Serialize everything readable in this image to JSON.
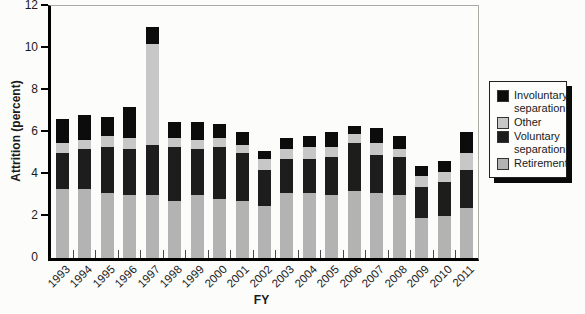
{
  "chart_data": {
    "type": "bar",
    "stacked": true,
    "title": "",
    "xlabel": "FY",
    "ylabel": "Attrition (percent)",
    "ylim": [
      0,
      12
    ],
    "yticks": [
      0,
      2,
      4,
      6,
      8,
      10,
      12
    ],
    "grid": false,
    "legend_position": "right-outside",
    "categories": [
      "1993",
      "1994",
      "1995",
      "1996",
      "1997",
      "1998",
      "1999",
      "2000",
      "2001",
      "2002",
      "2003",
      "2004",
      "2005",
      "2006",
      "2007",
      "2008",
      "2009",
      "2010",
      "2011"
    ],
    "series": [
      {
        "name": "Retirement",
        "color": "#b3b3b3",
        "values": [
          3.3,
          3.3,
          3.1,
          3.0,
          3.0,
          2.7,
          3.0,
          2.8,
          2.7,
          2.5,
          3.1,
          3.1,
          3.0,
          3.2,
          3.1,
          3.0,
          1.9,
          2.0,
          2.4
        ]
      },
      {
        "name": "Voluntary separation",
        "color": "#1d1d1d",
        "values": [
          1.7,
          1.9,
          2.2,
          2.2,
          2.4,
          2.6,
          2.2,
          2.5,
          2.3,
          1.7,
          1.6,
          1.6,
          1.8,
          2.3,
          1.8,
          1.8,
          1.5,
          1.6,
          1.8
        ]
      },
      {
        "name": "Other",
        "color": "#c7c7c7",
        "values": [
          0.5,
          0.4,
          0.5,
          0.5,
          4.8,
          0.4,
          0.4,
          0.4,
          0.4,
          0.5,
          0.5,
          0.6,
          0.5,
          0.4,
          0.6,
          0.4,
          0.5,
          0.5,
          0.8
        ]
      },
      {
        "name": "Involuntary separation",
        "color": "#0c0c0c",
        "values": [
          1.1,
          1.2,
          0.9,
          1.5,
          0.8,
          0.8,
          0.9,
          0.7,
          0.6,
          0.4,
          0.5,
          0.5,
          0.7,
          0.4,
          0.7,
          0.6,
          0.5,
          0.5,
          1.0
        ]
      }
    ]
  },
  "legend": {
    "items": [
      {
        "label": "Involuntary separation",
        "color": "#0c0c0c"
      },
      {
        "label": "Other",
        "color": "#c7c7c7"
      },
      {
        "label": "Voluntary separation",
        "color": "#1d1d1d"
      },
      {
        "label": "Retirement",
        "color": "#b3b3b3"
      }
    ]
  }
}
